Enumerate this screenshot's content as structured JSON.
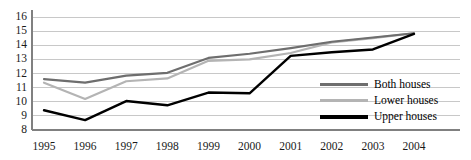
{
  "chart_data": {
    "type": "line",
    "title": "",
    "subtitle": "",
    "xlabel": "",
    "ylabel": "",
    "categories": [
      "1995",
      "1996",
      "1997",
      "1998",
      "1999",
      "2000",
      "2001",
      "2002",
      "2003",
      "2004"
    ],
    "x": [
      1995,
      1996,
      1997,
      1998,
      1999,
      2000,
      2001,
      2002,
      2003,
      2004
    ],
    "ylim": [
      8,
      16
    ],
    "xlim": [
      1995,
      2004
    ],
    "y_ticks": [
      8,
      9,
      10,
      11,
      12,
      13,
      14,
      15,
      16
    ],
    "y_tick_labels": [
      "8",
      "9",
      "10",
      "11",
      "12",
      "13",
      "14",
      "15",
      "16"
    ],
    "grid": true,
    "grid_axis": "y",
    "legend_position": "center-right",
    "series": [
      {
        "name": "Both houses",
        "color": "#6e6e6e",
        "values": [
          11.6,
          11.35,
          11.85,
          12.05,
          13.1,
          13.4,
          13.8,
          14.25,
          14.55,
          14.85
        ]
      },
      {
        "name": "Lower houses",
        "color": "#b4b4b4",
        "values": [
          11.35,
          10.2,
          11.45,
          11.65,
          12.9,
          13.0,
          13.45,
          14.2,
          14.5,
          14.85
        ]
      },
      {
        "name": "Upper houses",
        "color": "#000000",
        "values": [
          9.4,
          8.7,
          10.05,
          9.75,
          10.65,
          10.6,
          13.25,
          13.5,
          13.7,
          14.8
        ]
      }
    ]
  },
  "legend": {
    "items": [
      {
        "label": "Both houses",
        "color": "#6e6e6e",
        "thickness": 3
      },
      {
        "label": "Lower houses",
        "color": "#b4b4b4",
        "thickness": 3
      },
      {
        "label": "Upper houses",
        "color": "#000000",
        "thickness": 3.5
      }
    ]
  },
  "axes": {
    "y_label_0": "8",
    "y_label_1": "9",
    "y_label_2": "10",
    "y_label_3": "11",
    "y_label_4": "12",
    "y_label_5": "13",
    "y_label_6": "14",
    "y_label_7": "15",
    "y_label_8": "16"
  },
  "colors": {
    "both_houses": "#6e6e6e",
    "lower_houses": "#b4b4b4",
    "upper_houses": "#000000",
    "gridline": "#c8c8c8",
    "axis": "#808080",
    "background": "#ffffff",
    "text": "#1a1a1a"
  }
}
